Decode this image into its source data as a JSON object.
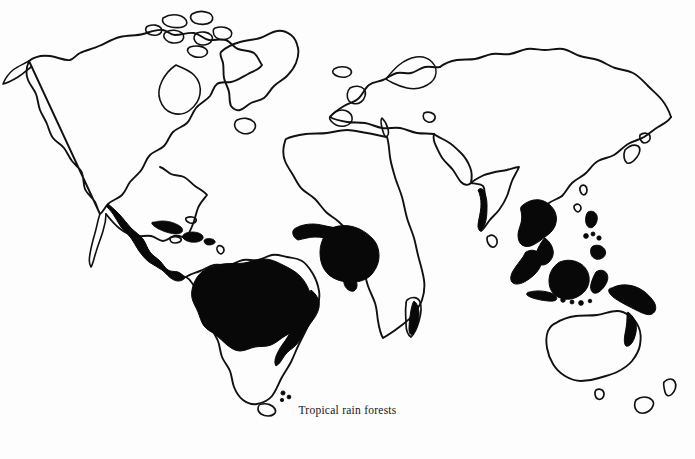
{
  "figure": {
    "caption": "Tropical rain forests",
    "title": "Tropical rain forests",
    "projection": "world map, equirectangular-style outline",
    "background_color": "#fdfdfd",
    "coastline_color": "#111111",
    "forest_fill_color": "#080808",
    "caption_color": "#141414"
  },
  "legend": {
    "implied_symbol_label": "Tropical rain forests",
    "symbol_description": "solid black fill",
    "symbol_color": "#080808"
  },
  "map_data": {
    "type": "choropleth-outline",
    "shaded_category": "Tropical rain forests",
    "landmasses": [
      {
        "name": "North America",
        "shaded": false
      },
      {
        "name": "Greenland",
        "shaded": false
      },
      {
        "name": "Canadian Arctic Archipelago",
        "shaded": false
      },
      {
        "name": "Central America",
        "shaded": true
      },
      {
        "name": "Caribbean islands",
        "shaded": true
      },
      {
        "name": "South America",
        "shaded": true
      },
      {
        "name": "Amazon Basin",
        "shaded": true
      },
      {
        "name": "Brazilian Atlantic coast",
        "shaded": true
      },
      {
        "name": "Tierra del Fuego",
        "shaded": false
      },
      {
        "name": "Falkland Islands",
        "shaded": false
      },
      {
        "name": "Europe",
        "shaded": false
      },
      {
        "name": "Iceland",
        "shaded": false
      },
      {
        "name": "Scandinavia",
        "shaded": false
      },
      {
        "name": "Africa",
        "shaded": true
      },
      {
        "name": "West African Guinea coast",
        "shaded": true
      },
      {
        "name": "Congo Basin",
        "shaded": true
      },
      {
        "name": "Madagascar",
        "shaded": true
      },
      {
        "name": "Arabian Peninsula",
        "shaded": false
      },
      {
        "name": "Asia",
        "shaded": false
      },
      {
        "name": "Siberia",
        "shaded": false
      },
      {
        "name": "India Western Ghats",
        "shaded": true
      },
      {
        "name": "Sri Lanka",
        "shaded": false
      },
      {
        "name": "Indochina",
        "shaded": true
      },
      {
        "name": "Malay Peninsula",
        "shaded": true
      },
      {
        "name": "Sumatra",
        "shaded": true
      },
      {
        "name": "Borneo",
        "shaded": true
      },
      {
        "name": "Java",
        "shaded": true
      },
      {
        "name": "Sulawesi",
        "shaded": true
      },
      {
        "name": "Philippines",
        "shaded": true
      },
      {
        "name": "New Guinea",
        "shaded": true
      },
      {
        "name": "Japan",
        "shaded": false
      },
      {
        "name": "Australia",
        "shaded": false
      },
      {
        "name": "Queensland coast",
        "shaded": true
      },
      {
        "name": "Tasmania",
        "shaded": false
      },
      {
        "name": "New Zealand",
        "shaded": false
      }
    ]
  }
}
